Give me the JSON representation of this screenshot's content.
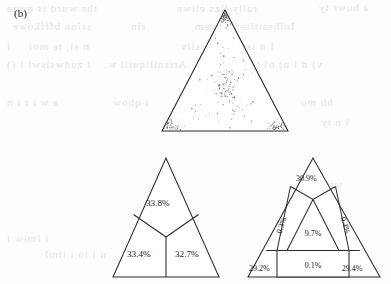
{
  "panel": {
    "label": "(b)"
  },
  "background_artifacts": {
    "note": "faint mirrored show-through text from reverse page",
    "lines": [
      {
        "text": "the wurd is quite",
        "x": 6,
        "y": 2,
        "size": 11
      },
      {
        "text": "rally lizs eliwe",
        "x": 176,
        "y": 2,
        "size": 11
      },
      {
        "text": "a huwr ty",
        "x": 318,
        "y": 1,
        "size": 11
      },
      {
        "text": "ssion bfffkowe",
        "x": 12,
        "y": 20,
        "size": 11
      },
      {
        "text": "rin",
        "x": 130,
        "y": 20,
        "size": 11
      },
      {
        "text": "Inihsattlier mavem,",
        "x": 190,
        "y": 20,
        "size": 11
      },
      {
        "text": "i",
        "x": 6,
        "y": 40,
        "size": 11
      },
      {
        "text": "n  si,   te    moi",
        "x": 28,
        "y": 40,
        "size": 11
      },
      {
        "text": "l  n   iswwyeryrsiiv",
        "x": 180,
        "y": 40,
        "size": 11
      },
      {
        "text": "i zudwsiswi i ()",
        "x": 6,
        "y": 58,
        "size": 11
      },
      {
        "text": "Artsniliquili w.",
        "x": 104,
        "y": 58,
        "size": 11
      },
      {
        "text": "v) d i n) o) ()gs n",
        "x": 228,
        "y": 58,
        "size": 11
      },
      {
        "text": "a   w  i t  i  n",
        "x": 6,
        "y": 96,
        "size": 11
      },
      {
        "text": "i qhow",
        "x": 112,
        "y": 96,
        "size": 11
      },
      {
        "text": "niiuliyuaw",
        "x": 176,
        "y": 96,
        "size": 11
      },
      {
        "text": "hh   mo",
        "x": 300,
        "y": 96,
        "size": 11
      },
      {
        "text": "i n ty",
        "x": 320,
        "y": 116,
        "size": 11
      },
      {
        "text": "wiiigiitu",
        "x": 296,
        "y": 178,
        "size": 11
      },
      {
        "text": "i lmiw  i",
        "x": 6,
        "y": 232,
        "size": 11
      },
      {
        "text": "n   i  io    i     iiml",
        "x": 44,
        "y": 248,
        "size": 11
      }
    ]
  },
  "chart_data": [
    {
      "id": "ternary-scatter",
      "type": "scatter",
      "projection": "ternary-triangle",
      "title": "",
      "xlabel": "",
      "ylabel": "",
      "grid": false,
      "legend": null,
      "vertices": {
        "apex": [
          225,
          10
        ],
        "left": [
          162,
          131
        ],
        "right": [
          288,
          131
        ]
      },
      "n_points": 240,
      "clusters": [
        {
          "name": "apex",
          "center_xy": [
            225,
            18
          ],
          "weight": 0.18
        },
        {
          "name": "centroid",
          "center_xy": [
            226,
            86
          ],
          "weight": 0.34
        },
        {
          "name": "left-vertex",
          "center_xy": [
            170,
            126
          ],
          "weight": 0.2
        },
        {
          "name": "right-vertex",
          "center_xy": [
            281,
            126
          ],
          "weight": 0.2
        },
        {
          "name": "scatter",
          "center_xy": [
            225,
            95
          ],
          "weight": 0.08
        }
      ]
    },
    {
      "id": "ternary-partition-3",
      "type": "table",
      "title": "",
      "regions": [
        {
          "label": "33.8%",
          "value": 33.8,
          "position": "top"
        },
        {
          "label": "33.4%",
          "value": 33.4,
          "position": "bottom-left"
        },
        {
          "label": "32.7%",
          "value": 32.7,
          "position": "bottom-right"
        }
      ],
      "total": 99.9,
      "vertices": {
        "apex": [
          166,
          158
        ],
        "left": [
          113,
          277
        ],
        "right": [
          219,
          277
        ]
      }
    },
    {
      "id": "ternary-partition-7",
      "type": "table",
      "title": "",
      "regions": [
        {
          "label": "30.9%",
          "value": 30.9,
          "position": "top"
        },
        {
          "label": "0.3%",
          "value": 0.3,
          "position": "left-edge-strip",
          "rotated": true
        },
        {
          "label": "0.4%",
          "value": 0.4,
          "position": "right-edge-strip",
          "rotated": true
        },
        {
          "label": "9.7%",
          "value": 9.7,
          "position": "center"
        },
        {
          "label": "29.2%",
          "value": 29.2,
          "position": "bottom-left"
        },
        {
          "label": "0.1%",
          "value": 0.1,
          "position": "bottom-center"
        },
        {
          "label": "29.4%",
          "value": 29.4,
          "position": "bottom-right"
        }
      ],
      "total": 100.0,
      "vertices": {
        "apex": [
          313,
          158
        ],
        "left": [
          248,
          277
        ],
        "right": [
          380,
          277
        ]
      }
    }
  ]
}
